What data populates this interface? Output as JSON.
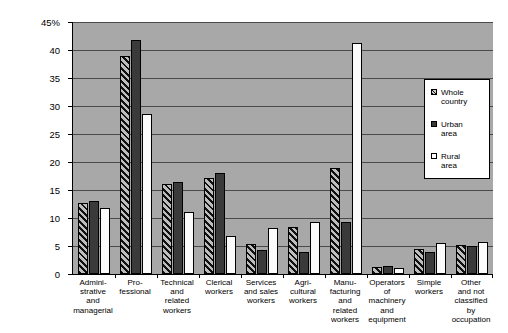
{
  "chart_data": {
    "type": "bar",
    "title": "",
    "subtitle": "",
    "xlabel": "",
    "ylabel": "",
    "ylim": [
      0,
      45
    ],
    "yticks": [
      0,
      5,
      10,
      15,
      20,
      25,
      30,
      35,
      40,
      45
    ],
    "ytick_labels": [
      "0",
      "5",
      "10",
      "15",
      "20",
      "25",
      "30",
      "35",
      "40",
      "45%"
    ],
    "grid": true,
    "legend_position": "right",
    "categories": [
      "Admini-\nstrative\nand\nmanagerial",
      "Pro-\nfessional",
      "Technical\nand\nrelated\nworkers",
      "Clerical\nworkers",
      "Services\nand sales\nworkers",
      "Agri-\ncultural\nworkers",
      "Manu-\nfacturing\nand\nrelated\nworkers",
      "Operators\nof\nmachinery\nand\nequipment",
      "Simple\nworkers",
      "Other\nand not\nclassified\nby\noccupation"
    ],
    "series": [
      {
        "name": "Whole\ncountry",
        "fill": "hatched",
        "values": [
          12.6,
          39.0,
          16.1,
          17.2,
          5.3,
          8.4,
          19.0,
          1.3,
          4.4,
          5.2
        ]
      },
      {
        "name": "Urban\narea",
        "fill": "dark-solid",
        "color": "#3a3a3a",
        "values": [
          13.1,
          41.7,
          16.5,
          18.1,
          4.3,
          4.0,
          9.3,
          1.5,
          4.0,
          5.0
        ]
      },
      {
        "name": "Rural\narea",
        "fill": "white",
        "color": "#ffffff",
        "values": [
          11.8,
          28.5,
          11.0,
          6.7,
          8.3,
          9.3,
          41.3,
          1.0,
          5.6,
          5.8
        ]
      }
    ],
    "plot_background": "#a8a8a8",
    "gridline_color": "#4a4a4a"
  }
}
